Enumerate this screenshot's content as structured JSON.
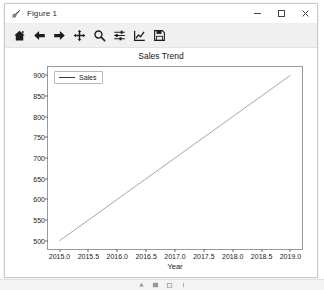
{
  "window": {
    "title": "Figure 1",
    "icon": "matplotlib-figure-icon",
    "controls": {
      "minimize": "minimize-icon",
      "maximize": "maximize-icon",
      "close": "close-icon"
    }
  },
  "toolbar": {
    "buttons": [
      {
        "name": "home-button",
        "icon": "home-icon",
        "tooltip": "Reset original view"
      },
      {
        "name": "back-button",
        "icon": "arrow-left-icon",
        "tooltip": "Back to previous view"
      },
      {
        "name": "forward-button",
        "icon": "arrow-right-icon",
        "tooltip": "Forward to next view"
      },
      {
        "name": "pan-button",
        "icon": "move-arrows-icon",
        "tooltip": "Pan axes with left mouse, zoom with right"
      },
      {
        "name": "zoom-button",
        "icon": "magnifier-icon",
        "tooltip": "Zoom to rectangle"
      },
      {
        "name": "configure-subplots-button",
        "icon": "sliders-icon",
        "tooltip": "Configure subplots"
      },
      {
        "name": "edit-axis-button",
        "icon": "axis-curve-icon",
        "tooltip": "Edit axis, curve and image parameters"
      },
      {
        "name": "save-button",
        "icon": "floppy-disk-icon",
        "tooltip": "Save the figure"
      }
    ]
  },
  "chart_data": {
    "type": "line",
    "title": "Sales Trend",
    "xlabel": "Year",
    "ylabel": "",
    "xlim": [
      2014.8,
      2019.2
    ],
    "ylim": [
      480,
      920
    ],
    "xticks": [
      2015.0,
      2015.5,
      2016.0,
      2016.5,
      2017.0,
      2017.5,
      2018.0,
      2018.5,
      2019.0
    ],
    "xticklabels": [
      "2015.0",
      "2015.5",
      "2016.0",
      "2016.5",
      "2017.0",
      "2017.5",
      "2018.0",
      "2018.5",
      "2019.0"
    ],
    "yticks": [
      500,
      550,
      600,
      650,
      700,
      750,
      800,
      850,
      900
    ],
    "yticklabels": [
      "500",
      "550",
      "600",
      "650",
      "700",
      "750",
      "800",
      "850",
      "900"
    ],
    "grid": false,
    "legend_position": "upper left",
    "series": [
      {
        "name": "Sales",
        "color": "#3a3a3a",
        "x": [
          2015,
          2016,
          2017,
          2018,
          2019
        ],
        "values": [
          500,
          600,
          700,
          800,
          900
        ]
      }
    ]
  },
  "taskbar": {
    "items": [
      "start-icon",
      "search-icon",
      "folder-icon",
      "app-icon"
    ]
  }
}
